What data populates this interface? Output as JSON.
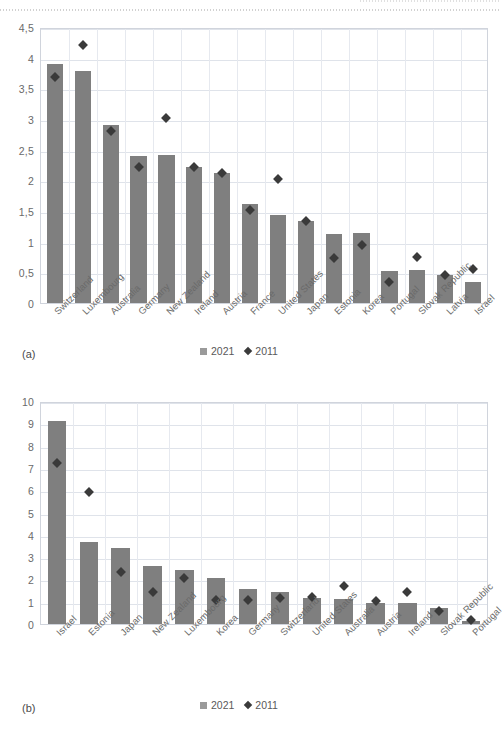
{
  "figure": {
    "panel_a_tag": "(a)",
    "panel_b_tag": "(b)"
  },
  "legend": {
    "series_2021": "2021",
    "series_2011": "2011",
    "marker_2021": "square-marker",
    "marker_2011": "diamond-marker",
    "color_2021": "#7f7f7f",
    "color_2011": "#3a3a3a"
  },
  "chart_data": [
    {
      "id": "chart-a",
      "type": "bar",
      "title": "",
      "xlabel": "",
      "ylabel": "",
      "ylim": [
        0,
        4.5
      ],
      "ytick_step": 0.5,
      "ytick_labels": [
        "0",
        "0,5",
        "1",
        "1,5",
        "2",
        "2,5",
        "3",
        "3,5",
        "4",
        "4,5"
      ],
      "decimal_separator": ",",
      "grid": true,
      "legend_position": "bottom-center",
      "categories": [
        "Switzerland",
        "Luxembourg",
        "Australia",
        "Germany",
        "New Zealand",
        "Ireland",
        "Austria",
        "France",
        "United States",
        "Japan",
        "Estonia",
        "Korea",
        "Portugal",
        "Slovak Republic",
        "Latvia",
        "Israel"
      ],
      "series": [
        {
          "name": "2021",
          "marker": "bar",
          "values": [
            3.89,
            3.79,
            2.9,
            2.4,
            2.41,
            2.22,
            2.12,
            1.61,
            1.43,
            1.33,
            1.13,
            1.14,
            0.53,
            0.54,
            0.45,
            0.35
          ]
        },
        {
          "name": "2011",
          "marker": "diamond",
          "values": [
            3.69,
            4.2,
            2.8,
            2.21,
            3.02,
            2.22,
            2.12,
            1.52,
            null,
            1.34,
            0.74,
            0.94,
            0.34,
            0.75,
            0.46,
            0.55
          ]
        }
      ],
      "extra_points_2011": {
        "United States": 2.03
      }
    },
    {
      "id": "chart-b",
      "type": "bar",
      "title": "",
      "xlabel": "",
      "ylabel": "",
      "ylim": [
        0,
        10
      ],
      "ytick_step": 1,
      "ytick_labels": [
        "0",
        "1",
        "2",
        "3",
        "4",
        "5",
        "6",
        "7",
        "8",
        "9",
        "10"
      ],
      "decimal_separator": ",",
      "grid": true,
      "legend_position": "bottom-center",
      "categories": [
        "Israel",
        "Estonia",
        "Japan",
        "New Zealand",
        "Luxembourg",
        "Korea",
        "Germany",
        "Switzerland",
        "United States",
        "Australia",
        "Austria",
        "Ireland",
        "Slovak Republic",
        "Portugal"
      ],
      "series": [
        {
          "name": "2021",
          "marker": "bar",
          "values": [
            9.1,
            3.7,
            3.4,
            2.62,
            2.42,
            2.05,
            1.55,
            1.45,
            1.18,
            1.11,
            0.95,
            0.95,
            0.72,
            0.15
          ]
        },
        {
          "name": "2011",
          "marker": "diamond",
          "values": [
            7.2,
            5.92,
            2.32,
            1.42,
            2.05,
            1.07,
            1.09,
            1.18,
            1.21,
            1.72,
            1.04,
            1.44,
            0.58,
            0.16
          ]
        }
      ]
    }
  ]
}
